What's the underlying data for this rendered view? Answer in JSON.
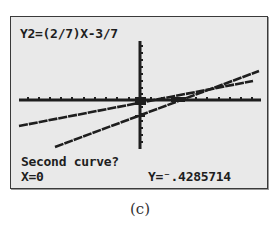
{
  "calculator_screen": {
    "function_label": "Y2=(2/7)X-3/7",
    "prompt": "Second curve?",
    "x_readout": "X=0",
    "y_readout": "Y=⁻.4285714",
    "mode": "intersect"
  },
  "graph": {
    "axes": {
      "x_axis_y_px": 83,
      "y_axis_x_px": 129,
      "tick_marks": true
    },
    "curves": [
      {
        "name": "Y1",
        "description": "shallower line",
        "x1": 8,
        "y1": 109,
        "x2": 242,
        "y2": 64
      },
      {
        "name": "Y2",
        "equation": "(2/7)X-3/7",
        "description": "steeper line",
        "x1": 44,
        "y1": 130,
        "x2": 248,
        "y2": 54
      }
    ],
    "cursor": {
      "x_px": 129,
      "y_px": 99,
      "x_value": 0,
      "y_value": -0.4285714
    },
    "colors": {
      "screen_bg": "#e9e9e9",
      "ink": "#1e1e1e"
    }
  },
  "caption": "(c)"
}
